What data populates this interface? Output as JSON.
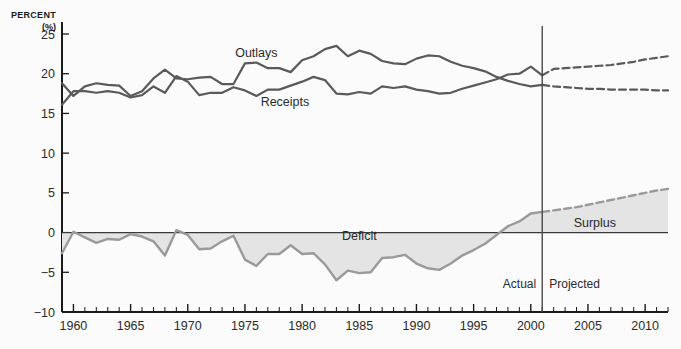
{
  "chart_data": {
    "type": "line",
    "title": "",
    "xlabel": "",
    "ylabel": "PERCENT",
    "ylabel_units": "(%)",
    "ylim": [
      -10,
      25
    ],
    "xlim": [
      1959,
      2012
    ],
    "yticks": [
      -10,
      -5,
      0,
      5,
      10,
      15,
      20,
      25
    ],
    "ytick_labels": [
      "−10",
      "−5",
      "0",
      "5",
      "10",
      "15",
      "20",
      "25"
    ],
    "xticks": [
      1960,
      1965,
      1970,
      1975,
      1980,
      1985,
      1990,
      1995,
      2000,
      2005,
      2010
    ],
    "xtick_labels": [
      "1960",
      "1965",
      "1970",
      "1975",
      "1980",
      "1985",
      "1990",
      "1995",
      "2000",
      "2005",
      "2010"
    ],
    "x_minor_step": 1,
    "grid": false,
    "legend_position": "inline-annotations",
    "divider_year": 2001,
    "phase_labels": {
      "actual": "Actual",
      "projected": "Projected"
    },
    "annotations": [
      {
        "name": "outlays",
        "text": "Outlays",
        "x": 1976.0,
        "y": 22.1
      },
      {
        "name": "receipts",
        "text": "Receipts",
        "x": 1978.5,
        "y": 15.9
      },
      {
        "name": "deficit",
        "text": "Deficit",
        "x": 1985.0,
        "y": -0.9
      },
      {
        "name": "surplus",
        "text": "Surplus",
        "x": 2005.6,
        "y": 0.7
      }
    ],
    "series": [
      {
        "name": "Outlays",
        "color": "#5a5a5a",
        "style": "solid",
        "x": [
          1959,
          1960,
          1961,
          1962,
          1963,
          1964,
          1965,
          1966,
          1967,
          1968,
          1969,
          1970,
          1971,
          1972,
          1973,
          1974,
          1975,
          1976,
          1977,
          1978,
          1979,
          1980,
          1981,
          1982,
          1983,
          1984,
          1985,
          1986,
          1987,
          1988,
          1989,
          1990,
          1991,
          1992,
          1993,
          1994,
          1995,
          1996,
          1997,
          1998,
          1999,
          2000,
          2001
        ],
        "values": [
          18.8,
          17.2,
          18.4,
          18.8,
          18.6,
          18.5,
          17.2,
          17.8,
          19.4,
          20.5,
          19.4,
          19.3,
          19.5,
          19.6,
          18.7,
          18.7,
          21.3,
          21.4,
          20.7,
          20.7,
          20.2,
          21.7,
          22.2,
          23.1,
          23.5,
          22.2,
          22.9,
          22.5,
          21.6,
          21.3,
          21.2,
          21.9,
          22.3,
          22.2,
          21.5,
          21.0,
          20.7,
          20.3,
          19.6,
          19.1,
          18.7,
          18.4,
          18.6
        ]
      },
      {
        "name": "Receipts",
        "color": "#5a5a5a",
        "style": "solid",
        "x": [
          1959,
          1960,
          1961,
          1962,
          1963,
          1964,
          1965,
          1966,
          1967,
          1968,
          1969,
          1970,
          1971,
          1972,
          1973,
          1974,
          1975,
          1976,
          1977,
          1978,
          1979,
          1980,
          1981,
          1982,
          1983,
          1984,
          1985,
          1986,
          1987,
          1988,
          1989,
          1990,
          1991,
          1992,
          1993,
          1994,
          1995,
          1996,
          1997,
          1998,
          1999,
          2000,
          2001
        ],
        "values": [
          16.1,
          17.8,
          17.8,
          17.6,
          17.8,
          17.6,
          17.0,
          17.3,
          18.4,
          17.6,
          19.7,
          19.0,
          17.3,
          17.6,
          17.6,
          18.3,
          17.9,
          17.2,
          18.0,
          18.0,
          18.5,
          19.0,
          19.6,
          19.2,
          17.5,
          17.4,
          17.7,
          17.5,
          18.4,
          18.2,
          18.4,
          18.0,
          17.8,
          17.5,
          17.6,
          18.1,
          18.5,
          18.9,
          19.3,
          19.9,
          20.0,
          20.9,
          19.8
        ]
      },
      {
        "name": "Outlays (Projected)",
        "color": "#5a5a5a",
        "style": "dashed",
        "x": [
          2001,
          2002,
          2003,
          2004,
          2005,
          2006,
          2007,
          2008,
          2009,
          2010,
          2011,
          2012
        ],
        "values": [
          18.6,
          18.4,
          18.3,
          18.2,
          18.1,
          18.1,
          18.0,
          18.0,
          18.0,
          18.0,
          17.9,
          17.9
        ]
      },
      {
        "name": "Receipts (Projected)",
        "color": "#5a5a5a",
        "style": "dashed",
        "x": [
          2001,
          2002,
          2003,
          2004,
          2005,
          2006,
          2007,
          2008,
          2009,
          2010,
          2011,
          2012
        ],
        "values": [
          19.8,
          20.6,
          20.7,
          20.8,
          20.9,
          21.0,
          21.1,
          21.3,
          21.5,
          21.8,
          22.0,
          22.2
        ]
      },
      {
        "name": "Deficit/Surplus",
        "color": "#9a9a9a",
        "fill": "#e4e4e4",
        "style": "solid",
        "x": [
          1959,
          1960,
          1961,
          1962,
          1963,
          1964,
          1965,
          1966,
          1967,
          1968,
          1969,
          1970,
          1971,
          1972,
          1973,
          1974,
          1975,
          1976,
          1977,
          1978,
          1979,
          1980,
          1981,
          1982,
          1983,
          1984,
          1985,
          1986,
          1987,
          1988,
          1989,
          1990,
          1991,
          1992,
          1993,
          1994,
          1995,
          1996,
          1997,
          1998,
          1999,
          2000,
          2001
        ],
        "values": [
          -2.6,
          0.1,
          -0.6,
          -1.3,
          -0.8,
          -0.9,
          -0.2,
          -0.5,
          -1.1,
          -2.9,
          0.3,
          -0.3,
          -2.1,
          -2.0,
          -1.1,
          -0.4,
          -3.4,
          -4.2,
          -2.7,
          -2.7,
          -1.6,
          -2.7,
          -2.6,
          -4.0,
          -6.0,
          -4.8,
          -5.1,
          -5.0,
          -3.2,
          -3.1,
          -2.8,
          -3.9,
          -4.5,
          -4.7,
          -3.9,
          -2.9,
          -2.2,
          -1.4,
          -0.3,
          0.8,
          1.4,
          2.4,
          2.6
        ]
      },
      {
        "name": "Surplus (Projected)",
        "color": "#9a9a9a",
        "fill": "#e4e4e4",
        "style": "dashed",
        "x": [
          2001,
          2002,
          2003,
          2004,
          2005,
          2006,
          2007,
          2008,
          2009,
          2010,
          2011,
          2012
        ],
        "values": [
          2.6,
          2.8,
          3.0,
          3.2,
          3.5,
          3.8,
          4.1,
          4.4,
          4.7,
          5.0,
          5.3,
          5.5
        ]
      }
    ]
  },
  "colors": {
    "background": "#fbfbfb",
    "axis": "#1a1a1a",
    "line": "#5a5a5a",
    "area_line": "#9a9a9a",
    "area_fill": "#e4e4e4",
    "divider": "#4a4a4a",
    "zero_line": "#3a3a3a",
    "text": "#2b2b2b"
  }
}
